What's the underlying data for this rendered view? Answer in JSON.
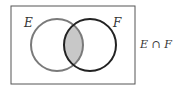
{
  "diagram": {
    "type": "venn",
    "sets": [
      {
        "name": "E",
        "label": "E",
        "stroke": "#7a7a7a"
      },
      {
        "name": "F",
        "label": "F",
        "stroke": "#222222"
      }
    ],
    "highlighted_region": "intersection",
    "highlight_fill": "#c8c8c8",
    "caption": "E ∩ F",
    "frame_stroke": "#555555"
  }
}
